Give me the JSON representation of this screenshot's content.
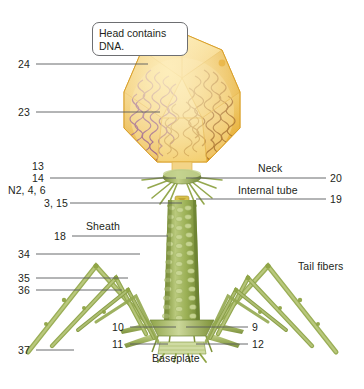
{
  "figure": {
    "callout": "Head contains DNA.",
    "bottom_caption_partial": "Structure of a phage T4 particle (clipped)"
  },
  "palette": {
    "head_fill": "#f0c24a",
    "head_light": "#fbe08a",
    "head_deep": "#e0a92f",
    "dna_purple": "#8e4d7a",
    "dna_brown": "#a9712c",
    "tail_green": "#8fa445",
    "tail_green_light": "#b8c777",
    "tail_green_dark": "#6f8433",
    "leader_line": "#58595b",
    "text": "#231f20"
  },
  "labels": {
    "left": [
      {
        "id": "l24",
        "text": "24",
        "x": 18,
        "y": 64,
        "leader": true
      },
      {
        "id": "l23",
        "text": "23",
        "x": 18,
        "y": 112,
        "leader": true
      },
      {
        "id": "l13",
        "text": "13",
        "x": 32,
        "y": 166,
        "leader": false
      },
      {
        "id": "l14",
        "text": "14",
        "x": 32,
        "y": 178,
        "leader": true
      },
      {
        "id": "lN2",
        "text": "N2, 4, 6",
        "x": 8,
        "y": 190,
        "leader": false
      },
      {
        "id": "l315",
        "text": "3, 15",
        "x": 44,
        "y": 203,
        "leader": true
      },
      {
        "id": "l18",
        "text": "18",
        "x": 54,
        "y": 236,
        "leader": true
      },
      {
        "id": "l34",
        "text": "34",
        "x": 18,
        "y": 254,
        "leader": true
      },
      {
        "id": "l35",
        "text": "35",
        "x": 18,
        "y": 278,
        "leader": true
      },
      {
        "id": "l36",
        "text": "36",
        "x": 18,
        "y": 290,
        "leader": true
      },
      {
        "id": "l10",
        "text": "10",
        "x": 112,
        "y": 327,
        "leader": true
      },
      {
        "id": "l11",
        "text": "11",
        "x": 112,
        "y": 344,
        "leader": true
      },
      {
        "id": "l37",
        "text": "37",
        "x": 18,
        "y": 350,
        "leader": true
      }
    ],
    "right": [
      {
        "id": "r20",
        "text": "20",
        "x": 330,
        "y": 178,
        "leader": true
      },
      {
        "id": "r19",
        "text": "19",
        "x": 330,
        "y": 199,
        "leader": true
      },
      {
        "id": "r9",
        "text": "9",
        "x": 252,
        "y": 327,
        "leader": true
      },
      {
        "id": "r12",
        "text": "12",
        "x": 252,
        "y": 344,
        "leader": true
      }
    ],
    "named": [
      {
        "id": "neck",
        "text": "Neck",
        "x": 258,
        "y": 168
      },
      {
        "id": "intube",
        "text": "Internal tube",
        "x": 238,
        "y": 190
      },
      {
        "id": "sheath",
        "text": "Sheath",
        "x": 86,
        "y": 226
      },
      {
        "id": "tailfib",
        "text": "Tail fibers",
        "x": 298,
        "y": 266
      },
      {
        "id": "baseplate",
        "text": "Baseplate",
        "x": 152,
        "y": 358
      }
    ]
  }
}
